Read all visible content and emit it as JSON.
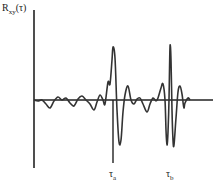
{
  "chart_data": {
    "type": "line",
    "title": "",
    "ylabel": "R_xy(τ)",
    "ylabel_main": "R",
    "ylabel_sub": "xy",
    "ylabel_arg": "(τ)",
    "xlabel": "",
    "grid": false,
    "legend": null,
    "annotations": [
      {
        "label": "τ_a",
        "main": "τ",
        "sub": "a",
        "x_px": 113,
        "description": "first correlation peak lag"
      },
      {
        "label": "τ_b",
        "main": "τ",
        "sub": "b",
        "x_px": 170,
        "description": "second correlation peak lag"
      }
    ],
    "axes": {
      "origin_px": [
        34,
        100
      ],
      "y_axis_px": {
        "x": 34,
        "top": 10,
        "bottom": 168
      },
      "x_axis_px": {
        "y": 100,
        "left": 34,
        "right": 213
      }
    },
    "series": [
      {
        "name": "cross-correlation",
        "description": "Low-amplitude oscillation then two high-amplitude bursts centered at τa and τb",
        "points_px": [
          [
            34,
            100
          ],
          [
            38,
            101
          ],
          [
            42,
            100
          ],
          [
            46,
            104
          ],
          [
            50,
            108
          ],
          [
            54,
            101
          ],
          [
            58,
            97
          ],
          [
            62,
            100
          ],
          [
            66,
            98
          ],
          [
            70,
            103
          ],
          [
            74,
            106
          ],
          [
            78,
            99
          ],
          [
            82,
            96
          ],
          [
            86,
            100
          ],
          [
            90,
            104
          ],
          [
            94,
            110
          ],
          [
            97,
            102
          ],
          [
            100,
            95
          ],
          [
            103,
            100
          ],
          [
            105,
            104
          ],
          [
            108,
            82
          ],
          [
            110,
            84
          ],
          [
            112,
            60
          ],
          [
            113,
            47
          ],
          [
            115,
            58
          ],
          [
            117,
            110
          ],
          [
            119,
            142
          ],
          [
            121,
            140
          ],
          [
            123,
            112
          ],
          [
            125,
            95
          ],
          [
            128,
            86
          ],
          [
            131,
            100
          ],
          [
            134,
            104
          ],
          [
            137,
            99
          ],
          [
            140,
            98
          ],
          [
            143,
            104
          ],
          [
            147,
            112
          ],
          [
            150,
            104
          ],
          [
            153,
            98
          ],
          [
            156,
            101
          ],
          [
            158,
            98
          ],
          [
            161,
            88
          ],
          [
            163,
            84
          ],
          [
            165,
            100
          ],
          [
            166,
            130
          ],
          [
            167,
            145
          ],
          [
            168,
            132
          ],
          [
            169,
            100
          ],
          [
            170,
            47
          ],
          [
            171,
            60
          ],
          [
            172,
            110
          ],
          [
            173,
            140
          ],
          [
            174,
            145
          ],
          [
            176,
            118
          ],
          [
            178,
            92
          ],
          [
            180,
            86
          ],
          [
            182,
            94
          ],
          [
            183,
            102
          ],
          [
            184,
            108
          ],
          [
            185,
            103
          ],
          [
            188,
            98
          ],
          [
            190,
            100
          ]
        ]
      }
    ]
  }
}
